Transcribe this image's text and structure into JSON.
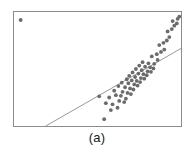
{
  "figure": {
    "caption": "(a)",
    "frame_color": "#8c8c8c",
    "background_color": "#ffffff"
  },
  "chart_data": {
    "type": "scatter",
    "title": "",
    "subtitle": "",
    "xlabel": "",
    "ylabel": "",
    "xlim": [
      0,
      100
    ],
    "ylim": [
      0,
      100
    ],
    "grid": false,
    "legend": false,
    "point_color": "#6b6b6b",
    "point_size_px": 2.6,
    "series": [
      {
        "name": "data",
        "x": [
          4.0,
          54.0,
          58.0,
          62.0,
          55.0,
          59.0,
          63.0,
          66.0,
          51.0,
          57.0,
          61.0,
          64.0,
          67.0,
          60.0,
          65.0,
          68.0,
          70.0,
          62.5,
          66.5,
          69.5,
          71.5,
          64.5,
          68.5,
          72.0,
          74.0,
          67.5,
          70.5,
          73.5,
          75.5,
          69.0,
          72.5,
          76.0,
          78.0,
          71.0,
          74.5,
          77.5,
          79.5,
          73.0,
          76.5,
          80.0,
          82.0,
          75.0,
          78.5,
          81.5,
          83.5,
          77.0,
          80.5,
          84.0,
          86.0,
          82.5,
          85.5,
          88.0,
          90.0,
          87.0,
          89.5,
          91.5,
          93.0,
          92.0,
          94.5,
          96.0,
          97.5,
          95.0,
          98.0,
          99.0
        ],
        "y": [
          93.0,
          6.0,
          14.0,
          16.0,
          20.0,
          19.0,
          22.0,
          21.0,
          26.0,
          25.0,
          27.0,
          26.5,
          24.0,
          31.0,
          30.0,
          29.0,
          28.0,
          35.0,
          34.0,
          33.0,
          32.0,
          38.0,
          37.5,
          36.5,
          35.5,
          41.0,
          40.0,
          39.5,
          38.5,
          44.0,
          43.0,
          42.0,
          41.5,
          47.0,
          46.0,
          45.5,
          44.5,
          50.0,
          49.0,
          48.0,
          47.5,
          53.0,
          52.0,
          51.5,
          50.5,
          56.0,
          55.0,
          54.5,
          58.0,
          61.0,
          63.0,
          65.0,
          67.0,
          71.0,
          73.0,
          75.0,
          78.0,
          83.0,
          85.0,
          88.0,
          90.0,
          92.0,
          94.0,
          96.0
        ]
      }
    ],
    "reference_line": {
      "name": "reference-line",
      "color": "#8c8c8c",
      "x1": 19.0,
      "y1": 0.0,
      "x2": 100.0,
      "y2": 68.0
    }
  }
}
